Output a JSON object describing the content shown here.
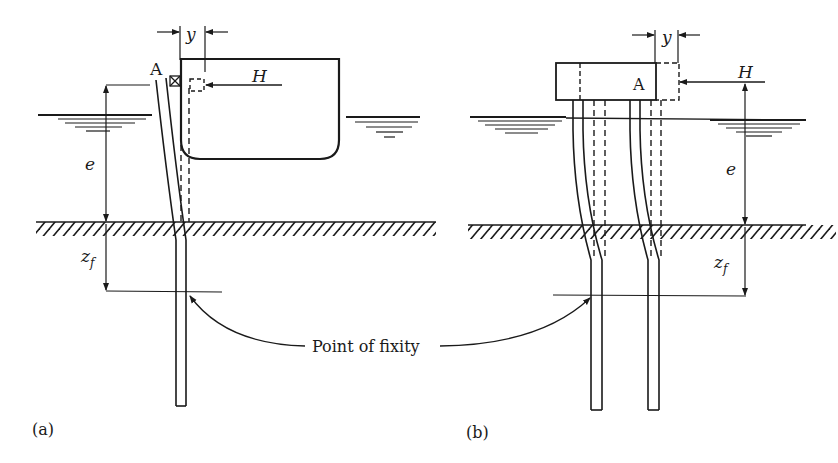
{
  "diagram": {
    "panels": [
      {
        "id": "a",
        "caption": "(a)",
        "labels": {
          "node": "A",
          "load": "H",
          "deflection": "y",
          "free_length": "e",
          "fixity_depth": "z",
          "fixity_sub": "f"
        }
      },
      {
        "id": "b",
        "caption": "(b)",
        "labels": {
          "node": "A",
          "load": "H",
          "deflection": "y",
          "free_length": "e",
          "fixity_depth": "z",
          "fixity_sub": "f"
        }
      }
    ],
    "shared_label": "Point of fixity",
    "colors": {
      "ink": "#1a1a1a",
      "background": "#ffffff"
    }
  }
}
